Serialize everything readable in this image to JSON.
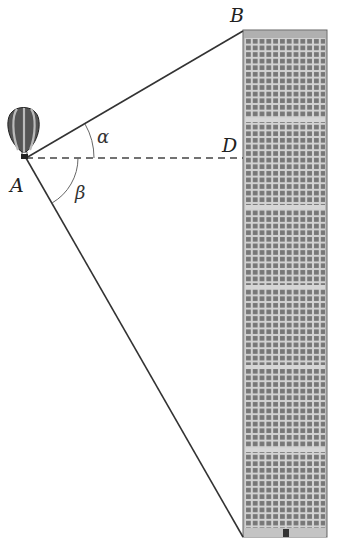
{
  "figure": {
    "labels": {
      "A": "A",
      "B": "B",
      "D": "D",
      "alpha": "α",
      "beta": "β"
    },
    "points": {
      "A": [
        26,
        158
      ],
      "B": [
        243,
        31
      ],
      "D": [
        243,
        158
      ],
      "bottom": [
        243,
        537
      ]
    },
    "building": {
      "x": 243,
      "y": 30,
      "width": 84,
      "height": 507,
      "window_columns": 12,
      "color_fill": "#9a9a9a",
      "color_window": "#6e6e6e",
      "color_grid": "#cfcfcf",
      "roof_color": "#b5b5b5"
    },
    "line_color": "#333333"
  }
}
